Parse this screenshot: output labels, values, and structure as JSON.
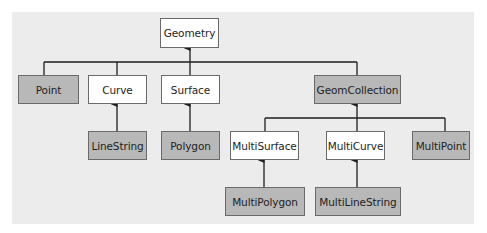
{
  "diagram": {
    "type": "class-hierarchy",
    "colors": {
      "background": "#ececec",
      "abstract_fill": "#ffffff",
      "concrete_fill": "#b8b8b8",
      "line": "#1e1e1e"
    },
    "nodes": {
      "geometry": {
        "label": "Geometry",
        "kind": "abstract"
      },
      "point": {
        "label": "Point",
        "kind": "concrete"
      },
      "curve": {
        "label": "Curve",
        "kind": "abstract"
      },
      "surface": {
        "label": "Surface",
        "kind": "abstract"
      },
      "geomcollection": {
        "label": "GeomCollection",
        "kind": "concrete"
      },
      "linestring": {
        "label": "LineString",
        "kind": "concrete"
      },
      "polygon": {
        "label": "Polygon",
        "kind": "concrete"
      },
      "multisurface": {
        "label": "MultiSurface",
        "kind": "abstract"
      },
      "multicurve": {
        "label": "MultiCurve",
        "kind": "abstract"
      },
      "multipoint": {
        "label": "MultiPoint",
        "kind": "concrete"
      },
      "multipolygon": {
        "label": "MultiPolygon",
        "kind": "concrete"
      },
      "multilinestring": {
        "label": "MultiLineString",
        "kind": "concrete"
      }
    },
    "edges": [
      {
        "from": "Point",
        "to": "Geometry"
      },
      {
        "from": "Curve",
        "to": "Geometry"
      },
      {
        "from": "Surface",
        "to": "Geometry"
      },
      {
        "from": "GeomCollection",
        "to": "Geometry"
      },
      {
        "from": "LineString",
        "to": "Curve"
      },
      {
        "from": "Polygon",
        "to": "Surface"
      },
      {
        "from": "MultiSurface",
        "to": "GeomCollection"
      },
      {
        "from": "MultiCurve",
        "to": "GeomCollection"
      },
      {
        "from": "MultiPoint",
        "to": "GeomCollection"
      },
      {
        "from": "MultiPolygon",
        "to": "MultiSurface"
      },
      {
        "from": "MultiLineString",
        "to": "MultiCurve"
      }
    ]
  }
}
